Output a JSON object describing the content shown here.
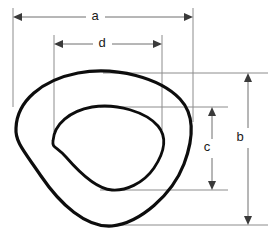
{
  "diagram": {
    "background_color": "#ffffff",
    "outline_color": "#0d0d0d",
    "dimension_line_color": "#6e6e6e",
    "extension_line_color": "#8c8c8c",
    "label_color": "#1a1a1a"
  },
  "dimensions": [
    {
      "id": "a",
      "label": "a",
      "orientation": "horizontal",
      "measures": "overall width of outer profile",
      "label_x": 95,
      "label_y": 17,
      "line_y": 17,
      "from_x": 13,
      "to_x": 193
    },
    {
      "id": "d",
      "label": "d",
      "orientation": "horizontal",
      "measures": "overall width of inner profile",
      "label_x": 102,
      "label_y": 44,
      "line_y": 44,
      "from_x": 54,
      "to_x": 162
    },
    {
      "id": "b",
      "label": "b",
      "orientation": "vertical",
      "measures": "overall height of outer profile",
      "label_x": 240,
      "label_y": 138,
      "line_x": 248,
      "from_y": 73,
      "to_y": 225
    },
    {
      "id": "c",
      "label": "c",
      "orientation": "vertical",
      "measures": "overall height of inner profile",
      "label_x": 207,
      "label_y": 148,
      "line_x": 212,
      "from_y": 107,
      "to_y": 190
    }
  ],
  "shapes": [
    {
      "id": "outer-profile",
      "name": "outer-rounded-triangle",
      "stroke_width": 3.2,
      "bounds": {
        "left": 13,
        "top": 72,
        "right": 193,
        "bottom": 226
      },
      "path": "M 16 128 C 17 101 42 80 78 73 C 116 66 160 78 180 99 C 196 116 193 140 184 164 C 172 195 140 223 112 226 C 86 228 60 204 41 176 C 24 151 15 142 16 128 Z"
    },
    {
      "id": "inner-profile",
      "name": "inner-rounded-triangle",
      "stroke_width": 2.8,
      "bounds": {
        "left": 51,
        "top": 106,
        "right": 163,
        "bottom": 190
      },
      "path": "M 53 141 C 54 124 70 111 92 107 C 117 103 146 112 158 126 C 168 138 164 153 154 168 C 143 184 125 191 112 190 C 96 189 79 172 66 157 C 56 146 52 148 53 141 Z"
    }
  ],
  "extension_lines": [
    {
      "id": "ext-a-left",
      "name": "extension-line-a-left",
      "x1": 13,
      "y1": 8,
      "x2": 13,
      "y2": 107
    },
    {
      "id": "ext-a-right",
      "name": "extension-line-a-right",
      "x1": 193,
      "y1": 8,
      "x2": 193,
      "y2": 122
    },
    {
      "id": "ext-d-left",
      "name": "extension-line-d-left",
      "x1": 54,
      "y1": 35,
      "x2": 54,
      "y2": 132
    },
    {
      "id": "ext-d-right",
      "name": "extension-line-d-right",
      "x1": 162,
      "y1": 35,
      "x2": 162,
      "y2": 130
    },
    {
      "id": "ext-b-top",
      "name": "extension-line-b-top",
      "x1": 103,
      "y1": 73,
      "x2": 268,
      "y2": 73
    },
    {
      "id": "ext-b-bot",
      "name": "extension-line-b-bottom",
      "x1": 103,
      "y1": 225,
      "x2": 268,
      "y2": 225
    },
    {
      "id": "ext-c-top",
      "name": "extension-line-c-top",
      "x1": 100,
      "y1": 107,
      "x2": 228,
      "y2": 107
    },
    {
      "id": "ext-c-bot",
      "name": "extension-line-c-bottom",
      "x1": 100,
      "y1": 190,
      "x2": 228,
      "y2": 190
    }
  ]
}
